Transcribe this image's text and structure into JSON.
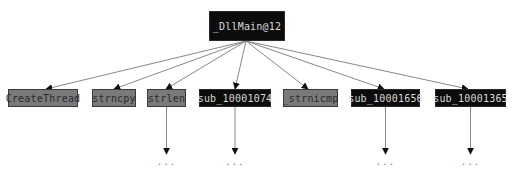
{
  "graph": {
    "root": {
      "id": "root",
      "label": "_DllMain@12",
      "style": "dark"
    },
    "children": [
      {
        "id": "c0",
        "label": "CreateThread",
        "style": "gray",
        "has_more": false
      },
      {
        "id": "c1",
        "label": "strncpy",
        "style": "gray",
        "has_more": false
      },
      {
        "id": "c2",
        "label": "strlen",
        "style": "gray",
        "has_more": true
      },
      {
        "id": "c3",
        "label": "sub_10001074",
        "style": "dark",
        "has_more": true
      },
      {
        "id": "c4",
        "label": "_strnicmp",
        "style": "gray",
        "has_more": false
      },
      {
        "id": "c5",
        "label": "sub_10001656",
        "style": "dark",
        "has_more": true
      },
      {
        "id": "c6",
        "label": "sub_10001365",
        "style": "dark",
        "has_more": true
      }
    ],
    "more_label": "...",
    "colors": {
      "dark_fill": "#0c0c0c",
      "dark_text": "#d8d8d8",
      "gray_fill": "#7a7a7a",
      "gray_text": "#2a2a2a",
      "edge": "#888888",
      "arrowhead": "#111111"
    }
  }
}
